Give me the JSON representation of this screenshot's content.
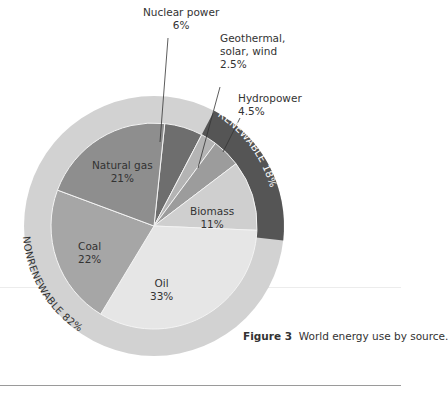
{
  "chart_data": {
    "type": "pie",
    "title": "World energy use by source.",
    "figure_label": "Figure 3",
    "series": [
      {
        "name": "Nuclear power",
        "value": 6,
        "label": "6%",
        "group": "Nonrenewable",
        "color": "#6e6e6e"
      },
      {
        "name": "Geothermal, solar, wind",
        "value": 2.5,
        "label": "2.5%",
        "group": "Renewable",
        "color": "#b4b4b4"
      },
      {
        "name": "Hydropower",
        "value": 4.5,
        "label": "4.5%",
        "group": "Renewable",
        "color": "#9c9c9c"
      },
      {
        "name": "Biomass",
        "value": 11,
        "label": "11%",
        "group": "Renewable",
        "color": "#cfcfcf"
      },
      {
        "name": "Oil",
        "value": 33,
        "label": "33%",
        "group": "Nonrenewable",
        "color": "#e6e6e6"
      },
      {
        "name": "Coal",
        "value": 22,
        "label": "22%",
        "group": "Nonrenewable",
        "color": "#a6a6a6"
      },
      {
        "name": "Natural gas",
        "value": 21,
        "label": "21%",
        "group": "Nonrenewable",
        "color": "#8e8e8e"
      }
    ],
    "outer_ring": [
      {
        "name": "RENEWABLE",
        "value": 18,
        "label": "RENEWABLE 18%",
        "color": "#555555"
      },
      {
        "name": "NONRENEWABLE",
        "value": 82,
        "label": "NONRENEWABLE 82%",
        "color": "#d2d2d2"
      }
    ],
    "start_angle_deg": 6
  },
  "labels": {
    "nuclear_name": "Nuclear power",
    "nuclear_pct": "6%",
    "geo_name1": "Geothermal,",
    "geo_name2": "solar, wind",
    "geo_pct": "2.5%",
    "hydro_name": "Hydropower",
    "hydro_pct": "4.5%",
    "biomass_name": "Biomass",
    "biomass_pct": "11%",
    "oil_name": "Oil",
    "oil_pct": "33%",
    "coal_name": "Coal",
    "coal_pct": "22%",
    "gas_name": "Natural gas",
    "gas_pct": "21%",
    "renewable_ring": "RENEWABLE 18%",
    "nonrenewable_ring": "NONRENEWABLE 82%"
  },
  "caption": {
    "figure": "Figure 3",
    "text": "World energy use by source."
  }
}
